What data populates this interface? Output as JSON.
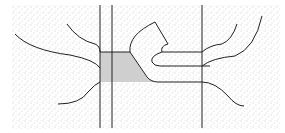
{
  "diagram": {
    "type": "schematic line drawing",
    "background": {
      "fill": "stippled",
      "color": "#9a9a9a"
    },
    "colors": {
      "line": "#222222",
      "shaded_region": "#cfcfcf",
      "paper": "#ffffff"
    },
    "vertical_lines": 3,
    "shaded_region": "trapezoid block between first two vertical lines",
    "curves_left": 4,
    "curves_right": 3,
    "horizontal_channels": 3
  }
}
